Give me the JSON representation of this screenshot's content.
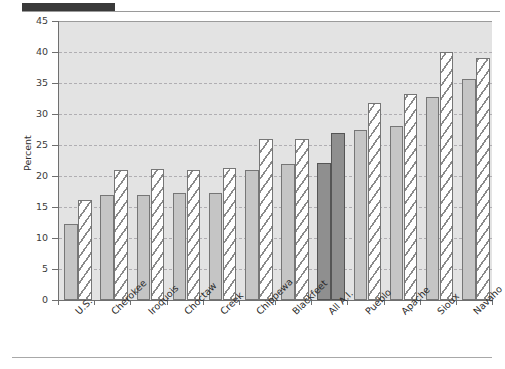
{
  "figure": {
    "header_rule": "dark-rule",
    "accent_color": "#3a3a3a",
    "plot_background": "#e3e3e3"
  },
  "chart_data": {
    "type": "bar",
    "title": "",
    "xlabel": "",
    "ylabel": "Percent",
    "ylim": [
      0,
      45
    ],
    "yticks": [
      0,
      5,
      10,
      15,
      20,
      25,
      30,
      35,
      40,
      45
    ],
    "ytick_labels": [
      "0",
      "5",
      "10",
      "15",
      "20",
      "25",
      "30",
      "35",
      "40",
      "45"
    ],
    "grid": true,
    "grid_axis": "y",
    "legend": "none",
    "categories": [
      "U.S.",
      "Cherokee",
      "Iroquois",
      "Choctaw",
      "Creek",
      "Chippewa",
      "Blackfeet",
      "All A.I.",
      "Pueblo",
      "Apache",
      "Sioux",
      "Navaho"
    ],
    "series": [
      {
        "name": "Series 1",
        "style": "solid-gray",
        "color": "#c5c5c5",
        "values": [
          12.3,
          17.0,
          17.0,
          17.3,
          17.2,
          21.0,
          21.9,
          22.1,
          27.5,
          28.1,
          32.8,
          35.7
        ]
      },
      {
        "name": "Series 2",
        "style": "hatched",
        "color": "#ffffff",
        "values": [
          16.1,
          21.0,
          21.2,
          21.0,
          21.3,
          26.0,
          26.0,
          26.9,
          31.8,
          33.3,
          40.0,
          39.0
        ]
      }
    ],
    "highlighted_category": "All A.I.",
    "highlight_color": "#8f8f8f"
  }
}
